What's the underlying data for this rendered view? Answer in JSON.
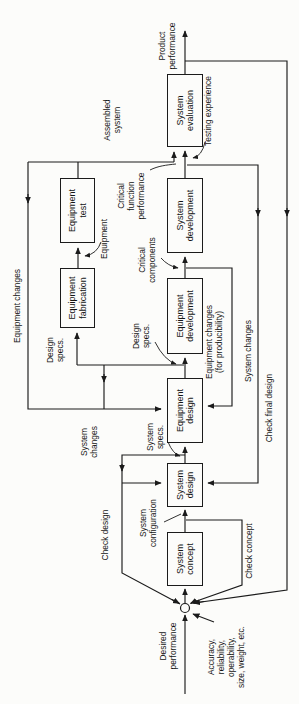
{
  "diagram": {
    "title_hint": "system development process flow diagram (scanned textbook figure, rotated 90 degrees)",
    "boxes": {
      "system_concept": "System\nconcept",
      "system_design": "System\ndesign",
      "equipment_design": "Equipment\ndesign",
      "equipment_development": "Equipment\ndevelopment",
      "system_development": "System\ndevelopment",
      "system_evaluation": "System\nevaluation",
      "equipment_fabrication": "Equipment\nfabrication",
      "equipment_test": "Equipment\ntest"
    },
    "inputs": {
      "desired_performance": "Desired\nperformance",
      "requirements": "Accuracy,\nreliability,\noperability,\nsize, weight, etc."
    },
    "output": {
      "product_performance": "Product\nperformance"
    },
    "flow_labels": {
      "system_configuration": "System\nconfiguration",
      "system_specs": "System\nspecs.",
      "design_specs_to_development": "Design\nspecs.",
      "design_specs_to_fabrication": "Design\nspecs.",
      "critical_components": "Critical\ncomponents",
      "critical_function_performance": "Critical\nfunction\nperformance",
      "equipment": "Equipment",
      "assembled_system": "Assembled\nsystem",
      "testing_experience": "Testing experience"
    },
    "feedback_labels": {
      "check_concept": "Check concept",
      "check_design": "Check design",
      "check_final_design": "Check final design",
      "system_changes_left": "System\nchanges",
      "system_changes_right": "System changes",
      "equipment_changes": "Equipment changes",
      "equipment_changes_producibility": "Equipment changes\n(for producibility)"
    },
    "colors": {
      "line": "#1b1b1b",
      "text": "#141414",
      "background": "#fcfcfa"
    }
  }
}
